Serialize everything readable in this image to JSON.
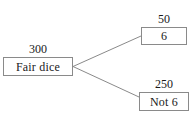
{
  "diagram": {
    "type": "tree-diagram",
    "colors": {
      "background": "#ffffff",
      "box_border": "#8a8a8a",
      "edge_line": "#8a8a8a",
      "text": "#1a1a1a"
    },
    "root": {
      "label": "Fair dice",
      "count": "300"
    },
    "branches": [
      {
        "name": "six",
        "label": "6",
        "count": "50"
      },
      {
        "name": "not-six",
        "label": "Not 6",
        "count": "250"
      }
    ]
  }
}
